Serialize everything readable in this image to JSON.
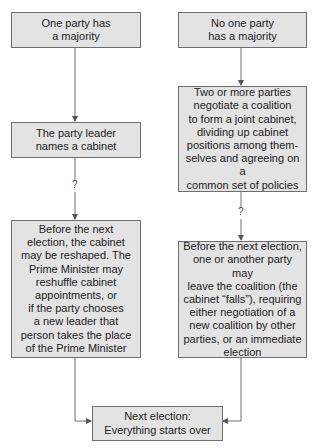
{
  "diagram": {
    "colors": {
      "box_fill": "#e3e3e3",
      "box_border": "#6e6e6e",
      "line": "#6e6e6e"
    },
    "left": {
      "start": "One party has\na majority",
      "step": "The party leader\nnames a cabinet",
      "connector_label": "?",
      "outcome": "Before the next\nelection, the cabinet\nmay be reshaped. The\nPrime Minister may\nreshuffle cabinet\nappointments, or\nif the party chooses\na new leader that\nperson takes the place\nof the Prime Minister"
    },
    "right": {
      "start": "No one party\nhas a majority",
      "step": "Two or more parties\nnegotiate a coalition\nto form a joint cabinet,\ndividing up cabinet\npositions among them-\nselves and agreeing on a\ncommon set of policies",
      "connector_label": "?",
      "outcome": "Before the next election,\none or another party may\nleave the coalition (the\ncabinet “falls”), requiring\neither negotiation of a\nnew coalition by other\nparties, or an immediate\nelection"
    },
    "end": "Next election:\nEverything starts over"
  }
}
